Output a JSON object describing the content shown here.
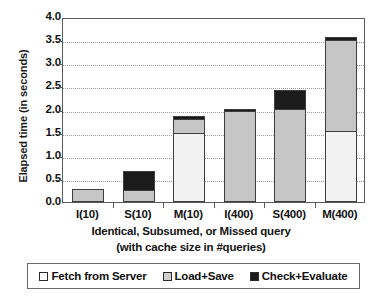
{
  "chart_data": {
    "type": "bar",
    "subtype": "stacked-bar",
    "title": "",
    "xlabel": "Identical, Subsumed, or Missed query (with cache size in #queries)",
    "xlabel_line1": "Identical, Subsumed, or Missed query",
    "xlabel_line2": "(with cache size in #queries)",
    "ylabel": "Elapsed time (in seconds)",
    "ylim": [
      0.0,
      4.0
    ],
    "ytick_step": 0.5,
    "yticks": [
      "0.0",
      "0.5",
      "1.0",
      "1.5",
      "2.0",
      "2.5",
      "3.0",
      "3.5",
      "4.0"
    ],
    "ytick_values": [
      0.0,
      0.5,
      1.0,
      1.5,
      2.0,
      2.5,
      3.0,
      3.5,
      4.0
    ],
    "grid": true,
    "grid_style": "dotted-horizontal",
    "legend_position": "bottom",
    "categories": [
      "I(10)",
      "S(10)",
      "M(10)",
      "I(400)",
      "S(400)",
      "M(400)"
    ],
    "series": [
      {
        "name": "Fetch from Server",
        "color": "#f2f2f2",
        "values": [
          0.0,
          0.0,
          1.49,
          0.0,
          0.0,
          1.53
        ]
      },
      {
        "name": "Load+Save",
        "color": "#c6c6c6",
        "values": [
          0.28,
          0.27,
          0.31,
          1.97,
          2.01,
          1.97
        ]
      },
      {
        "name": "Check+Evaluate",
        "color": "#1b1b1b",
        "values": [
          0.0,
          0.41,
          0.06,
          0.02,
          0.42,
          0.07
        ]
      }
    ],
    "totals": [
      0.28,
      0.68,
      1.86,
      1.99,
      2.43,
      3.57
    ]
  },
  "legend": {
    "items": [
      {
        "label": "Fetch from Server",
        "swatch": "white-square-icon"
      },
      {
        "label": "Load+Save",
        "swatch": "gray-square-icon"
      },
      {
        "label": "Check+Evaluate",
        "swatch": "black-square-icon"
      }
    ]
  },
  "colors": {
    "fetch": "#f2f2f2",
    "load": "#c6c6c6",
    "check": "#1b1b1b",
    "axis": "#5a5a5a",
    "grid": "#9a9a9a",
    "text": "#111111",
    "background": "#ffffff"
  }
}
